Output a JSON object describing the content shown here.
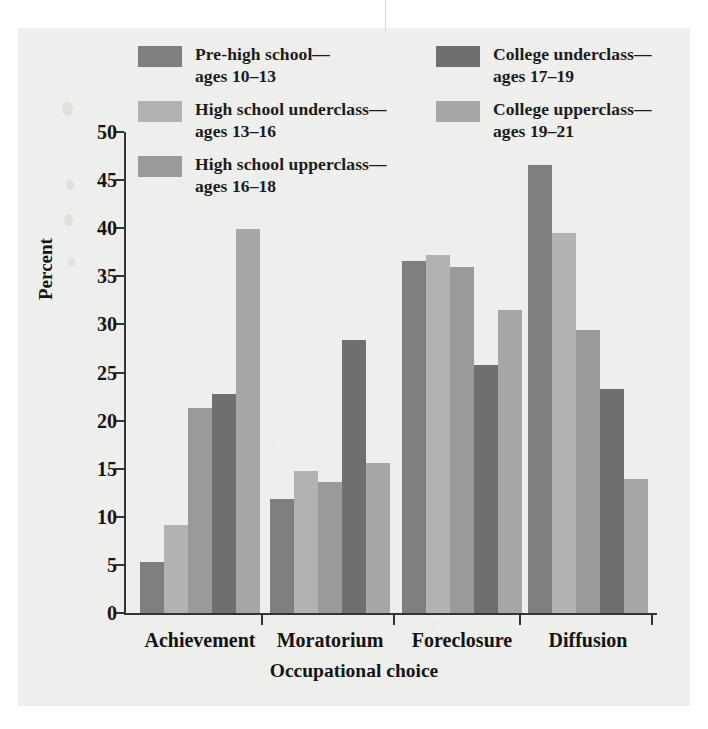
{
  "figure": {
    "kind": "grouped-bar-chart"
  },
  "chart_data": {
    "type": "bar",
    "title": "",
    "xlabel": "Occupational choice",
    "ylabel": "Percent",
    "ylim": [
      0,
      50
    ],
    "yticks": [
      0,
      5,
      10,
      15,
      20,
      25,
      30,
      35,
      40,
      45,
      50
    ],
    "ytick_labels": [
      "0",
      "5",
      "10",
      "15",
      "20",
      "25",
      "30",
      "35",
      "40",
      "45",
      "50"
    ],
    "grid": false,
    "legend_position": "top-inside",
    "categories": [
      "Achievement",
      "Moratorium",
      "Foreclosure",
      "Diffusion"
    ],
    "series": [
      {
        "name": "Pre-high school—ages 10–13",
        "label_line1": "Pre-high school—",
        "label_line2": "ages 10–13",
        "color": "#807f80",
        "values": [
          5.3,
          11.8,
          36.6,
          46.6
        ]
      },
      {
        "name": "High school underclass—ages 13–16",
        "label_line1": "High school underclass—",
        "label_line2": "ages 13–16",
        "color": "#b2b2b0",
        "values": [
          9.2,
          14.8,
          37.2,
          39.5
        ]
      },
      {
        "name": "High school upperclass—ages 16–18",
        "label_line1": "High school upperclass—",
        "label_line2": "ages 16–18",
        "color": "#9a9a98",
        "values": [
          21.3,
          13.6,
          36.0,
          29.4
        ]
      },
      {
        "name": "College underclass—ages 17–19",
        "label_line1": "College underclass—",
        "label_line2": "ages 17–19",
        "color": "#6f6f6f",
        "values": [
          22.8,
          28.4,
          25.8,
          23.3
        ]
      },
      {
        "name": "College upperclass—ages 19–21",
        "label_line1": "College upperclass—",
        "label_line2": "ages 19–21",
        "color": "#a6a6a4",
        "values": [
          39.9,
          15.6,
          31.5,
          13.9
        ]
      }
    ]
  }
}
